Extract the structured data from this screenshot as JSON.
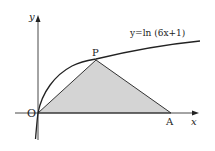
{
  "diagram": {
    "curve_equation": "y=ln (6x+1)",
    "points": {
      "origin": "O",
      "P": "P",
      "A": "A"
    },
    "axes": {
      "x_label": "x",
      "y_label": "y"
    },
    "shaded_region": "triangle OPA",
    "colors": {
      "shade": "#d4d4d4",
      "line": "#222222"
    }
  }
}
